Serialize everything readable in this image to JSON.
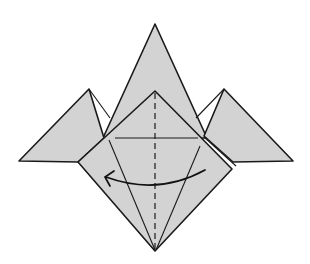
{
  "diagram": {
    "title": "",
    "colors": {
      "paper": "#d3d3d3",
      "line": "#1a1a1a",
      "background": "#ffffff"
    },
    "elements": {
      "back_triangle": {
        "points": "155,24 103,138 207,138"
      },
      "left_flap": {
        "points": "89,89 19,161 78,162 104,138"
      },
      "left_flap_crease": {
        "points": "89,89 110,118"
      },
      "right_flap": {
        "points": "224,89 293,161 233,162 204,136"
      },
      "right_flap_crease": {
        "points": "224,89 196,118"
      },
      "front_square": {
        "points": "155,91 232,169 155,251 78,162"
      },
      "front_square_layer_edge": {
        "points": "204,137 236,166"
      },
      "horizontal_crease": {
        "x1": 115,
        "y1": 138,
        "x2": 198,
        "y2": 138
      },
      "left_diagonal_crease": {
        "x1": 109,
        "y1": 140,
        "x2": 155,
        "y2": 250
      },
      "right_diagonal_crease": {
        "x1": 200,
        "y1": 146,
        "x2": 156,
        "y2": 250
      },
      "valley_fold_line": {
        "x1": 155,
        "y1": 93,
        "x2": 155,
        "y2": 249
      },
      "fold_arrow": {
        "path": "M 205 170 Q 158 196 106 177",
        "head": "M 114 171 L 105 177 L 110 186",
        "direction": "right-to-left"
      }
    }
  }
}
